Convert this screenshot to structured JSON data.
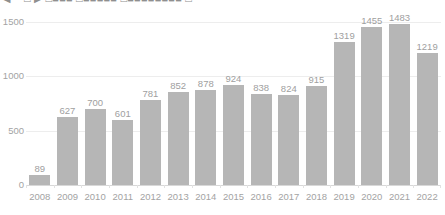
{
  "window": {
    "clipped_title": "◀ ━ □ ▶  □■■■  □■■■■■  □■■■■■■■■  □"
  },
  "colors": {
    "bar_fill": "#b6b6b6",
    "gridline": "#ededed",
    "axis_line": "#d8d8d8",
    "label_text": "#a0a0a0",
    "tick_text": "#a3a3a3",
    "background": "#ffffff"
  },
  "chart_data": {
    "type": "bar",
    "title": "",
    "subtitle": "",
    "xlabel": "",
    "ylabel": "",
    "categories": [
      "2008",
      "2009",
      "2010",
      "2011",
      "2012",
      "2013",
      "2014",
      "2015",
      "2016",
      "2017",
      "2018",
      "2019",
      "2020",
      "2021",
      "2022"
    ],
    "values": [
      89,
      627,
      700,
      601,
      781,
      852,
      878,
      924,
      838,
      824,
      915,
      1319,
      1455,
      1483,
      1219
    ],
    "data_labels": [
      "89",
      "627",
      "700",
      "601",
      "781",
      "852",
      "878",
      "924",
      "838",
      "824",
      "915",
      "1319",
      "1455",
      "1483",
      "1219"
    ],
    "ylim": [
      0,
      1500
    ],
    "yticks": [
      0,
      500,
      1000,
      1500
    ],
    "ytick_labels": [
      "0",
      "500",
      "1000",
      "1500"
    ],
    "grid": true,
    "legend": null,
    "legend_position": "none",
    "series": [
      {
        "name": "",
        "values": [
          89,
          627,
          700,
          601,
          781,
          852,
          878,
          924,
          838,
          824,
          915,
          1319,
          1455,
          1483,
          1219
        ]
      }
    ]
  }
}
